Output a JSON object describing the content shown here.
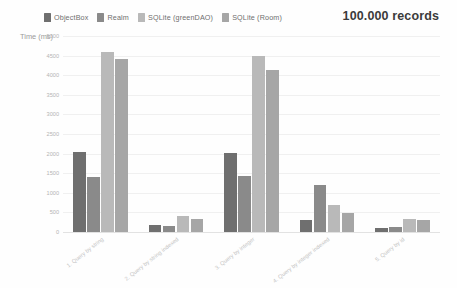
{
  "header": {
    "records_label": "100.000 records"
  },
  "legend": {
    "position": "top-left",
    "items": [
      {
        "label": "ObjectBox",
        "color": "#6f6f6f"
      },
      {
        "label": "Realm",
        "color": "#8a8a8a"
      },
      {
        "label": "SQLite (greenDAO)",
        "color": "#b9b9b9"
      },
      {
        "label": "SQLite (Room)",
        "color": "#a6a6a6"
      }
    ]
  },
  "axes": {
    "ylabel": "Time (ms)",
    "yticks": [
      "5000",
      "4500",
      "4000",
      "3500",
      "3000",
      "2500",
      "2000",
      "1500",
      "1000",
      "500",
      "0"
    ]
  },
  "chart_data": {
    "type": "bar",
    "title": "100.000 records",
    "xlabel": "",
    "ylabel": "Time (ms)",
    "ylim": [
      0,
      5000
    ],
    "grid": true,
    "legend_position": "top-left",
    "categories": [
      "1. Query by string",
      "2. Query by string indexed",
      "3. Query by integer",
      "4. Query by integer indexed",
      "5. Query by id"
    ],
    "series": [
      {
        "name": "ObjectBox",
        "color": "#6f6f6f",
        "values": [
          2050,
          170,
          2020,
          300,
          90
        ]
      },
      {
        "name": "Realm",
        "color": "#8a8a8a",
        "values": [
          1400,
          160,
          1430,
          1210,
          130
        ]
      },
      {
        "name": "SQLite (greenDAO)",
        "color": "#b9b9b9",
        "values": [
          4580,
          420,
          4480,
          700,
          330
        ]
      },
      {
        "name": "SQLite (Room)",
        "color": "#a6a6a6",
        "values": [
          4420,
          320,
          4130,
          490,
          310
        ]
      }
    ]
  }
}
